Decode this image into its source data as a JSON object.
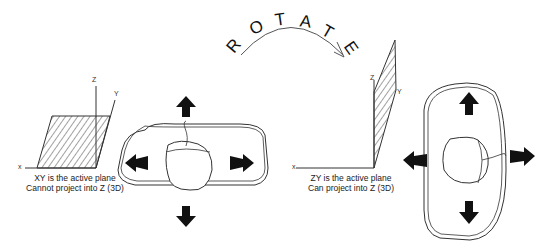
{
  "rotate_letters": [
    "R",
    "O",
    "T",
    "A",
    "T",
    "E"
  ],
  "left_panel": {
    "axes": {
      "z": "Z",
      "y": "Y",
      "x": "x"
    },
    "caption_line1": "XY is the active plane",
    "caption_line2": "Cannot project into Z (3D)"
  },
  "right_panel": {
    "axes": {
      "z": "Z",
      "y": "Y",
      "x": "x"
    },
    "caption_line1": "ZY is the active plane",
    "caption_line2": "Can project into Z (3D)"
  },
  "icons": {
    "left_mouse": "mouse-on-pad-horizontal",
    "right_mouse": "mouse-on-pad-vertical",
    "arrows": [
      "arrow-up",
      "arrow-down",
      "arrow-left",
      "arrow-right"
    ]
  },
  "colors": {
    "line": "#222222",
    "fill": "#111111",
    "hatch": "#444444",
    "background": "#ffffff"
  }
}
